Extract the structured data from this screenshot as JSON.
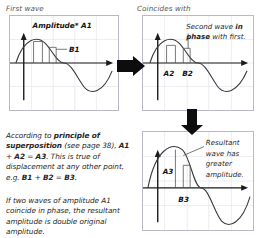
{
  "figure": {
    "title_first": "First wave",
    "title_coincides": "Coincides with"
  },
  "panels": {
    "first_wave": {
      "name": "First wave graph",
      "amplitude_label": "Amplitude* A1",
      "b_label": "B1"
    },
    "second_wave": {
      "name": "Second wave graph",
      "note_line1": "Second wave ",
      "note_line1_bold": "in",
      "note_line2_bold": "phase",
      "note_line2": " with first.",
      "a_label": "A2",
      "b_label": "B2"
    },
    "resultant": {
      "name": "Resultant wave graph",
      "note_line1": "Resultant",
      "note_line2": "wave has",
      "note_line3": "greater",
      "note_line4": "amplitude.",
      "a_label": "A3",
      "b_label": "B3"
    }
  },
  "text": {
    "superposition": {
      "p1_a": "According to ",
      "p1_b": "principle of superposition",
      "p1_c": " (see page 38), ",
      "p1_d": "A1",
      "p1_e": " + ",
      "p1_f": "A2",
      "p1_g": " = ",
      "p1_h": "A3",
      "p1_i": ". This is true of displacement at any other point, e.g. ",
      "p1_j": "B1",
      "p1_k": " + ",
      "p1_l": "B2",
      "p1_m": " = ",
      "p1_n": "B3",
      "p1_o": "."
    },
    "conclusion": "If two waves of amplitude A1 coincide in phase, the resultant amplitude is double original amplitude."
  },
  "arrows": {
    "right": "arrow-right-block",
    "down": "arrow-down-block"
  },
  "colors": {
    "panel_border": "#b9b9c6",
    "grid": "#e2e2ea",
    "axis": "#1b1b1b",
    "curve": "#3a3a3a",
    "text": "#262626",
    "caption": "#555555",
    "arrow_fill": "#0d0d0d"
  }
}
